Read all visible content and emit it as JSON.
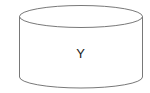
{
  "diagram": {
    "shape": "cylinder",
    "label": "Y",
    "stroke_color": "#555555",
    "fill_color": "#ffffff"
  }
}
